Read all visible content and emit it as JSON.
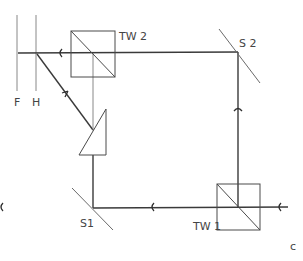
{
  "diagram": {
    "labels": {
      "tw2": "TW 2",
      "tw1": "TW 1",
      "s2": "S 2",
      "s1": "S1",
      "f": "F",
      "h": "H",
      "panel": "c"
    },
    "colors": {
      "line": "#3a3a3a",
      "background": "#ffffff"
    }
  }
}
